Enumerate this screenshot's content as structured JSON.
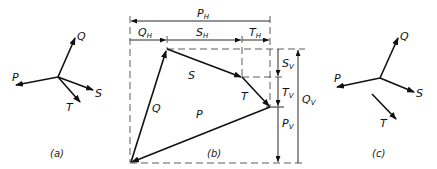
{
  "figure": {
    "panels": [
      {
        "id": "a",
        "caption": "(a)",
        "description": "Concurrent force system at a point",
        "forces": [
          "P",
          "Q",
          "S",
          "T"
        ]
      },
      {
        "id": "b",
        "caption": "(b)",
        "description": "Force polygon with horizontal and vertical components",
        "vectors": [
          {
            "name": "Q",
            "label": "Q"
          },
          {
            "name": "S",
            "label": "S"
          },
          {
            "name": "T",
            "label": "T"
          },
          {
            "name": "P",
            "label": "P"
          }
        ],
        "horizontal_dimensions": [
          {
            "label": "P",
            "sub": "H"
          },
          {
            "label": "Q",
            "sub": "H"
          },
          {
            "label": "S",
            "sub": "H"
          },
          {
            "label": "T",
            "sub": "H"
          }
        ],
        "vertical_dimensions": [
          {
            "label": "S",
            "sub": "V"
          },
          {
            "label": "T",
            "sub": "V"
          },
          {
            "label": "P",
            "sub": "V"
          },
          {
            "label": "Q",
            "sub": "V"
          }
        ]
      },
      {
        "id": "c",
        "caption": "(c)",
        "description": "Force system with T offset",
        "forces": [
          "P",
          "Q",
          "S",
          "T"
        ]
      }
    ],
    "labels": {
      "P": "P",
      "Q": "Q",
      "S": "S",
      "T": "T",
      "H": "H",
      "V": "V"
    },
    "colors": {
      "ink": "#111111",
      "background": "#ffffff"
    }
  }
}
